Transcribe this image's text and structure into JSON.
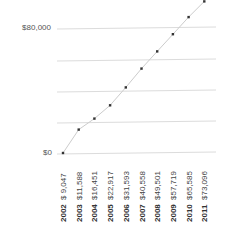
{
  "chart_data": {
    "type": "line",
    "title": "",
    "xlabel": "",
    "ylabel": "",
    "categories": [
      "2002",
      "2003",
      "2004",
      "2005",
      "2006",
      "2007",
      "2008",
      "2009",
      "2010",
      "2011"
    ],
    "value_labels": [
      "$ 9,047",
      "$11,588",
      "$16,451",
      "$22,917",
      "$31,593",
      "$40,558",
      "$49,501",
      "$57,719",
      "$65,585",
      "$73,096"
    ],
    "series": [
      {
        "name": "Value",
        "values": [
          9047,
          11588,
          16451,
          22917,
          31593,
          40558,
          49501,
          57719,
          65585,
          73096
        ]
      }
    ],
    "plotted_y_estimates": [
      0,
      15000,
      22000,
      30500,
      42000,
      54000,
      65000,
      76000,
      87000,
      97000
    ],
    "y_tick_labels": [
      {
        "label": "$80,000",
        "value": 80000
      },
      {
        "label": "$0",
        "value": 0
      }
    ],
    "gridlines": 4,
    "grid": true,
    "legend": "none",
    "ylim": [
      0,
      80000
    ],
    "colors": {
      "line": "#cccccc",
      "marker": "#333333",
      "grid": "#dddddd"
    }
  }
}
